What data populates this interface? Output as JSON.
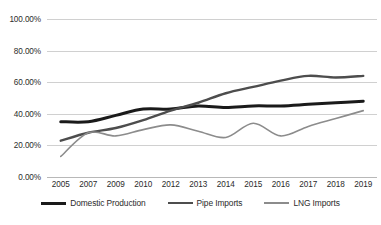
{
  "chart_data": {
    "type": "line",
    "title": "",
    "subtitle": "",
    "xlabel": "",
    "ylabel": "",
    "categories": [
      "2005",
      "2007",
      "2009",
      "2010",
      "2012",
      "2013",
      "2014",
      "2015",
      "2016",
      "2017",
      "2018",
      "2019"
    ],
    "ylim": [
      0,
      100
    ],
    "ytick_values": [
      0,
      20,
      40,
      60,
      80,
      100
    ],
    "ytick_labels": [
      "0.00%",
      "20.00%",
      "40.00%",
      "60.00%",
      "80.00%",
      "100.00%"
    ],
    "grid": true,
    "legend_position": "bottom",
    "series": [
      {
        "name": "Domestic Production",
        "color": "#1a1a1a",
        "line_width": 3,
        "values": [
          35,
          35,
          39,
          43,
          43,
          45,
          44,
          45,
          45,
          46,
          47,
          48
        ]
      },
      {
        "name": "Pipe Imports",
        "color": "#4d4d4d",
        "line_width": 2.4,
        "values": [
          23,
          28,
          31,
          36,
          42,
          47,
          53,
          57,
          61,
          64,
          63,
          64
        ]
      },
      {
        "name": "LNG Imports",
        "color": "#8c8c8c",
        "line_width": 1.6,
        "values": [
          13,
          28,
          26,
          30,
          33,
          29,
          25,
          34,
          26,
          32,
          37,
          42
        ]
      }
    ]
  }
}
